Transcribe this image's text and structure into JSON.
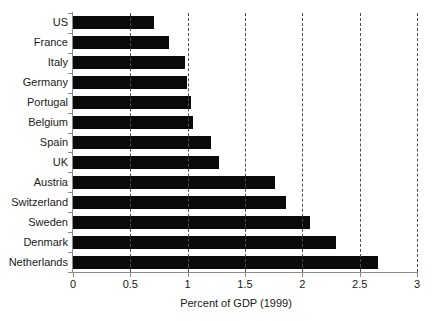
{
  "chart_data": {
    "type": "bar",
    "orientation": "horizontal",
    "title": "",
    "subtitle": "",
    "xlabel": "Percent of GDP (1999)",
    "ylabel": "",
    "xlim": [
      0,
      3
    ],
    "ylim": null,
    "grid": true,
    "grid_axis": "x",
    "grid_style": "dashed",
    "legend": false,
    "legend_position": "none",
    "bar_color": "#0a0a0a",
    "background_color": "#ffffff",
    "axis_color": "#8a8a8a",
    "xticks": [
      0,
      0.5,
      1,
      1.5,
      2,
      2.5,
      3
    ],
    "xtick_labels": [
      "0",
      "0.5",
      "1",
      "1.5",
      "2",
      "2.5",
      "3"
    ],
    "categories": [
      "US",
      "France",
      "Italy",
      "Germany",
      "Portugal",
      "Belgium",
      "Spain",
      "UK",
      "Austria",
      "Switzerland",
      "Sweden",
      "Denmark",
      "Netherlands"
    ],
    "values": [
      0.71,
      0.84,
      0.98,
      0.99,
      1.03,
      1.05,
      1.2,
      1.27,
      1.76,
      1.86,
      2.07,
      2.29,
      2.66
    ],
    "series": [
      {
        "name": "Percent of GDP (1999)",
        "values": [
          0.71,
          0.84,
          0.98,
          0.99,
          1.03,
          1.05,
          1.2,
          1.27,
          1.76,
          1.86,
          2.07,
          2.29,
          2.66
        ]
      }
    ]
  }
}
